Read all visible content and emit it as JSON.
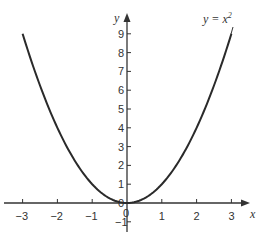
{
  "chart_data": {
    "type": "line",
    "title": "",
    "xlabel": "x",
    "ylabel": "y",
    "xlim": [
      -3.3,
      3.4
    ],
    "ylim": [
      -1.5,
      9.6
    ],
    "grid": false,
    "x_ticks": [
      "-3",
      "-2",
      "-1",
      "0",
      "1",
      "2",
      "3"
    ],
    "y_ticks": [
      "-1",
      "0",
      "1",
      "2",
      "3",
      "4",
      "5",
      "6",
      "7",
      "8",
      "9"
    ],
    "series": [
      {
        "name": "y = x^2",
        "function": "x^2",
        "x": [
          -3,
          -2.5,
          -2,
          -1.5,
          -1,
          -0.5,
          0,
          0.5,
          1,
          1.5,
          2,
          2.5,
          3
        ],
        "values": [
          9,
          6.25,
          4,
          2.25,
          1,
          0.25,
          0,
          0.25,
          1,
          2.25,
          4,
          6.25,
          9
        ]
      }
    ],
    "annotations": [
      {
        "text": "y = x",
        "superscript": "2",
        "x": 2.5,
        "y": 9.5
      }
    ],
    "colors": {
      "curve": "#2a2a2a",
      "axis": "#333333"
    }
  },
  "labels": {
    "x_axis": "x",
    "y_axis": "y",
    "curve_label": "y = x",
    "curve_label_sup": "2",
    "origin_y_label": "0",
    "origin_x_label": "0"
  }
}
